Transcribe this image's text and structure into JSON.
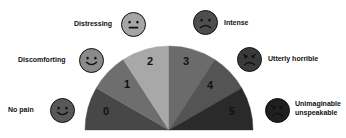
{
  "background": "#ffffff",
  "fan": {
    "center_x": 169,
    "center_y": 130,
    "radius": 84,
    "type": "half-circle-fan",
    "segments": [
      {
        "value": "0",
        "label_x": 106,
        "label_y": 112,
        "color": "#474747",
        "start_deg": 180,
        "end_deg": 150
      },
      {
        "value": "1",
        "label_x": 127,
        "label_y": 85,
        "color": "#6e6e6e",
        "start_deg": 150,
        "end_deg": 123
      },
      {
        "value": "2",
        "label_x": 150,
        "label_y": 62,
        "color": "#a8a8a8",
        "start_deg": 123,
        "end_deg": 90
      },
      {
        "value": "3",
        "label_x": 186,
        "label_y": 62,
        "color": "#6b6b6b",
        "start_deg": 90,
        "end_deg": 57
      },
      {
        "value": "4",
        "label_x": 210,
        "label_y": 86,
        "color": "#545454",
        "start_deg": 57,
        "end_deg": 30
      },
      {
        "value": "5",
        "label_x": 232,
        "label_y": 112,
        "color": "#2a2a2a",
        "start_deg": 30,
        "end_deg": 0
      }
    ]
  },
  "faces": [
    {
      "key": "no-pain",
      "caption": "No pain",
      "icon": "smiley-happy-face",
      "fill": "#585858",
      "expression": "smile",
      "eyebrows": "none",
      "cx": 62,
      "cy": 110,
      "size": 25,
      "caption_x": 8,
      "caption_y": 106,
      "caption_align": "left"
    },
    {
      "key": "discomforting",
      "caption": "Discomforting",
      "icon": "smiley-slight-smile-face",
      "fill": "#8a8a8a",
      "expression": "smile",
      "eyebrows": "none",
      "cx": 91,
      "cy": 60,
      "size": 25,
      "caption_x": 18,
      "caption_y": 56,
      "caption_align": "left"
    },
    {
      "key": "distressing",
      "caption": "Distressing",
      "icon": "smiley-neutral-face",
      "fill": "#a5a5a5",
      "expression": "flat",
      "eyebrows": "none",
      "cx": 133,
      "cy": 24,
      "size": 25,
      "caption_x": 74,
      "caption_y": 20,
      "caption_align": "left"
    },
    {
      "key": "intense",
      "caption": "Intense",
      "icon": "smiley-frown-face",
      "fill": "#4e4e4e",
      "expression": "frown",
      "eyebrows": "none",
      "cx": 205,
      "cy": 22,
      "size": 25,
      "caption_x": 224,
      "caption_y": 19,
      "caption_align": "left"
    },
    {
      "key": "utterly-horrible",
      "caption": "Utterly horrible",
      "icon": "smiley-angry-face",
      "fill": "#3a3a3a",
      "expression": "frown",
      "eyebrows": "angry",
      "cx": 249,
      "cy": 59,
      "size": 25,
      "caption_x": 268,
      "caption_y": 55,
      "caption_align": "left"
    },
    {
      "key": "unimaginable-unspeakable",
      "caption": "Unimaginable unspeakable",
      "caption_line1": "Unimaginable",
      "caption_line2": "unspeakable",
      "icon": "smiley-very-angry-face",
      "fill": "#1f1f1f",
      "expression": "frown",
      "eyebrows": "angry",
      "cx": 277,
      "cy": 110,
      "size": 25,
      "caption_x": 295,
      "caption_y": 100,
      "caption_align": "left"
    }
  ]
}
